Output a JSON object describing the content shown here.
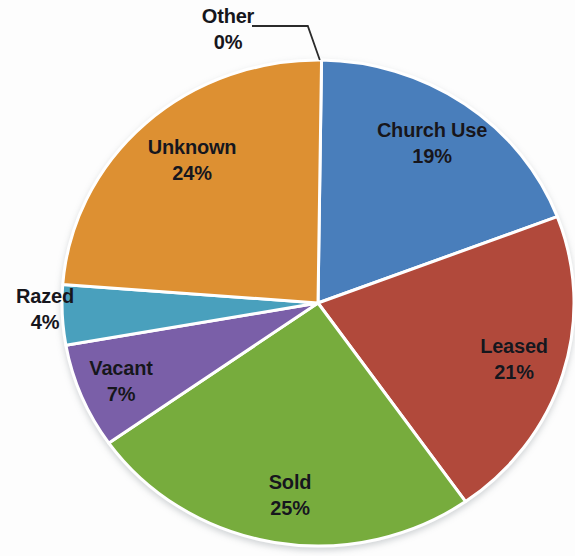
{
  "chart_data": {
    "type": "pie",
    "title": "",
    "subtitle": "",
    "xlabel": "",
    "ylabel": "",
    "legend_position": "none",
    "grid": false,
    "labels_show_percent": true,
    "start_angle_deg": 0,
    "direction": "clockwise",
    "categories": [
      "Other",
      "Church Use",
      "Leased",
      "Sold",
      "Vacant",
      "Razed",
      "Unknown"
    ],
    "values": [
      0,
      19,
      21,
      25,
      7,
      4,
      24
    ],
    "slices": [
      {
        "label": "Other",
        "percent_text": "0%",
        "value": 0,
        "color": "#f2f2f2",
        "label_placement": "outside",
        "leader_line": true
      },
      {
        "label": "Church Use",
        "percent_text": "19%",
        "value": 19,
        "color": "#4a7ebb",
        "label_placement": "inside",
        "leader_line": false
      },
      {
        "label": "Leased",
        "percent_text": "21%",
        "value": 21,
        "color": "#b1483a",
        "label_placement": "inside",
        "leader_line": false
      },
      {
        "label": "Sold",
        "percent_text": "25%",
        "value": 25,
        "color": "#77ac3d",
        "label_placement": "inside",
        "leader_line": false
      },
      {
        "label": "Vacant",
        "percent_text": "7%",
        "value": 7,
        "color": "#7a5ea8",
        "label_placement": "inside",
        "leader_line": false
      },
      {
        "label": "Razed",
        "percent_text": "4%",
        "value": 4,
        "color": "#4aa0bd",
        "label_placement": "outside",
        "leader_line": false
      },
      {
        "label": "Unknown",
        "percent_text": "24%",
        "value": 24,
        "color": "#dd9030",
        "label_placement": "inside",
        "leader_line": false
      }
    ],
    "colors": {
      "other": "#f2f2f2",
      "church_use": "#4a7ebb",
      "leased": "#b1483a",
      "sold": "#77ac3d",
      "vacant": "#7a5ea8",
      "razed": "#4aa0bd",
      "unknown": "#dd9030",
      "slice_border": "#ffffff",
      "label_text": "#16161c",
      "leader_line": "#2b2b2b",
      "background": "#fdfdfd"
    }
  }
}
